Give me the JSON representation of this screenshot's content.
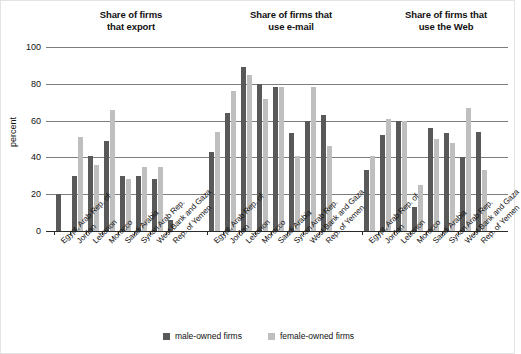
{
  "chart_data": {
    "type": "bar",
    "title": "",
    "xlabel": "",
    "ylabel": "percent",
    "ylim": [
      0,
      100
    ],
    "yticks": [
      0,
      20,
      40,
      60,
      80,
      100
    ],
    "grid": true,
    "legend_position": "bottom-center",
    "legend": [
      "male-owned firms",
      "female-owned firms"
    ],
    "colors": {
      "male": "#595959",
      "female": "#bfbfbf",
      "grid": "#7d7d7d",
      "axis": "#2b2b2b",
      "text": "#111111",
      "background": "#ffffff"
    },
    "categories": [
      "Egypt, Arab Rep. of",
      "Jordan",
      "Lebanon",
      "Morocco",
      "Saudi Arabia",
      "Syrian Arab Rep.",
      "West Bank and Gaza",
      "Rep. of Yemen"
    ],
    "panels": [
      {
        "title": "Share of firms that export",
        "title_line1": "Share of firms",
        "title_line2": "that export",
        "series": [
          {
            "name": "male-owned firms",
            "values": [
              20,
              30,
              41,
              49,
              30,
              30,
              28,
              6
            ]
          },
          {
            "name": "female-owned firms",
            "values": [
              0,
              51,
              36,
              66,
              28,
              35,
              35,
              0
            ]
          }
        ]
      },
      {
        "title": "Share of firms that use e-mail",
        "title_line1": "Share of firms that",
        "title_line2": "use e-mail",
        "series": [
          {
            "name": "male-owned firms",
            "values": [
              43,
              64,
              89,
              80,
              78,
              53,
              60,
              63
            ]
          },
          {
            "name": "female-owned firms",
            "values": [
              54,
              76,
              85,
              72,
              78,
              41,
              78,
              46
            ]
          }
        ]
      },
      {
        "title": "Share of firms that use the Web",
        "title_line1": "Share of firms that",
        "title_line2": "use the Web",
        "series": [
          {
            "name": "male-owned firms",
            "values": [
              33,
              52,
              60,
              13,
              56,
              53,
              40,
              54
            ]
          },
          {
            "name": "female-owned firms",
            "values": [
              41,
              61,
              60,
              25,
              50,
              48,
              67,
              33
            ]
          }
        ]
      }
    ]
  }
}
